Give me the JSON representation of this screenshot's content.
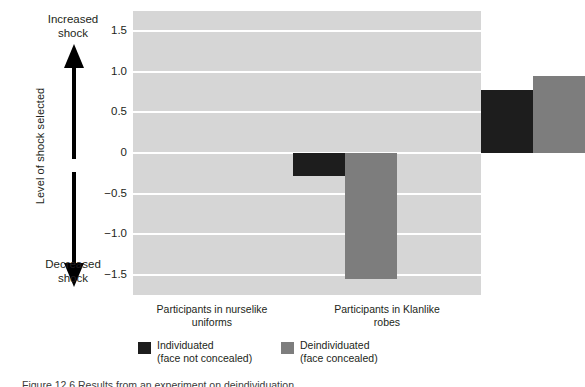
{
  "chart_data": {
    "type": "bar",
    "title": "",
    "subtitle": "",
    "xlabel": "",
    "ylabel": "Level of shock selected",
    "ylim": [
      -1.75,
      1.75
    ],
    "yticks": [
      "1.5",
      "1.0",
      "0.5",
      "0",
      "−0.5",
      "−1.0",
      "−1.5"
    ],
    "ytick_values": [
      1.5,
      1.0,
      0.5,
      0,
      -0.5,
      -1.0,
      -1.5
    ],
    "grid": true,
    "legend_position": "bottom",
    "categories": [
      "Participants in nurselike uniforms",
      "Participants in Klanlike robes"
    ],
    "series": [
      {
        "name": "Individuated (face not concealed)",
        "color": "#1d1d1d",
        "values": [
          -0.28,
          0.78
        ]
      },
      {
        "name": "Deindividuated (face concealed)",
        "color": "#7d7d7d",
        "values": [
          -1.55,
          0.95
        ]
      }
    ],
    "annotations": [
      {
        "text": "Increased shock",
        "direction": "up"
      },
      {
        "text": "Decreased shock",
        "direction": "down"
      }
    ]
  },
  "axis": {
    "y_title": "Level of shock selected",
    "ticks": [
      {
        "label": "1.5",
        "value": 1.5
      },
      {
        "label": "1.0",
        "value": 1.0
      },
      {
        "label": "0.5",
        "value": 0.5
      },
      {
        "label": "0",
        "value": 0
      },
      {
        "label": "−0.5",
        "value": -0.5
      },
      {
        "label": "−1.0",
        "value": -1.0
      },
      {
        "label": "−1.5",
        "value": -1.5
      }
    ]
  },
  "annotations": {
    "increased": {
      "line1": "Increased",
      "line2": "shock"
    },
    "decreased": {
      "line1": "Decreased",
      "line2": "shock"
    }
  },
  "categories": [
    {
      "line1": "Participants in nurselike",
      "line2": "uniforms"
    },
    {
      "line1": "Participants in Klanlike",
      "line2": "robes"
    }
  ],
  "legend": [
    {
      "line1": "Individuated",
      "line2": "(face not concealed)",
      "color": "#1d1d1d"
    },
    {
      "line1": "Deindividuated",
      "line2": "(face concealed)",
      "color": "#7d7d7d"
    }
  ],
  "caption": "Figure 12.6  Results from an experiment on deindividuation",
  "colors": {
    "plot_background": "#d6d6d6",
    "gridline": "#ffffff",
    "individuated": "#1d1d1d",
    "deindividuated": "#7d7d7d",
    "text": "#231f20"
  }
}
